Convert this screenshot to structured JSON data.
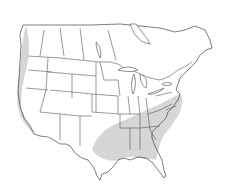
{
  "map": {
    "type": "species-range-map",
    "region": "North America (USA, southern Canada)",
    "projection": "Lambert-like conic",
    "colors": {
      "background": "#ffffff",
      "range_fill": "#d6d6d6",
      "borders": "#555555"
    },
    "range_areas": [
      {
        "name": "southeastern-range",
        "description": "Southeastern and south-central United States, from eastern Texas/Oklahoma east to the Atlantic coast and north to southern Great Lakes"
      },
      {
        "name": "pacific-coast-range",
        "description": "Pacific coast from British Columbia south through Washington, Oregon and California"
      }
    ]
  }
}
